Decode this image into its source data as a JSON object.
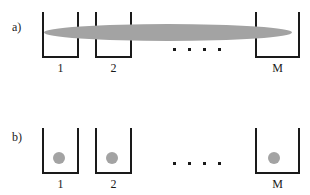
{
  "figure": {
    "background_color": "#ffffff",
    "stroke_color": "#1a1a1a",
    "gray_color": "#a3a3a3",
    "width": 310,
    "height": 195
  },
  "panels": [
    {
      "id": "panel-a",
      "label": "a)",
      "label_x": 12,
      "label_y": 21,
      "description": "delocalized condensate spanning all wells",
      "wells": [
        {
          "name": "well-1",
          "label": "1",
          "x": 42,
          "y": 12,
          "width": 37,
          "height": 46,
          "label_x": 42,
          "label_y": 62,
          "label_width": 37
        },
        {
          "name": "well-2",
          "label": "2",
          "x": 95,
          "y": 12,
          "width": 37,
          "height": 46,
          "label_x": 95,
          "label_y": 62,
          "label_width": 37
        },
        {
          "name": "well-m",
          "label": "M",
          "x": 255,
          "y": 12,
          "width": 45,
          "height": 46,
          "label_x": 255,
          "label_y": 62,
          "label_width": 45
        }
      ],
      "condensate": {
        "name": "delocalized-condensate",
        "x": 44,
        "y": 24,
        "width": 248,
        "height": 17
      },
      "ellipsis": {
        "name": "panel-a-ellipsis",
        "count": 4,
        "x": 173,
        "y": 48
      }
    },
    {
      "id": "panel-b",
      "label": "b)",
      "label_x": 12,
      "label_y": 131,
      "description": "localized atom in each individual well",
      "wells": [
        {
          "name": "well-1",
          "label": "1",
          "x": 42,
          "y": 128,
          "width": 37,
          "height": 46,
          "label_x": 42,
          "label_y": 178,
          "label_width": 37
        },
        {
          "name": "well-2",
          "label": "2",
          "x": 95,
          "y": 128,
          "width": 37,
          "height": 46,
          "label_x": 95,
          "label_y": 178,
          "label_width": 37
        },
        {
          "name": "well-m",
          "label": "M",
          "x": 255,
          "y": 128,
          "width": 45,
          "height": 46,
          "label_x": 255,
          "label_y": 178,
          "label_width": 45
        }
      ],
      "atoms": [
        {
          "name": "atom-1",
          "x": 53,
          "y": 152,
          "diameter": 12
        },
        {
          "name": "atom-2",
          "x": 106,
          "y": 152,
          "diameter": 12
        },
        {
          "name": "atom-m",
          "x": 268,
          "y": 152,
          "diameter": 12
        }
      ],
      "ellipsis": {
        "name": "panel-b-ellipsis",
        "count": 4,
        "x": 173,
        "y": 162
      }
    }
  ]
}
